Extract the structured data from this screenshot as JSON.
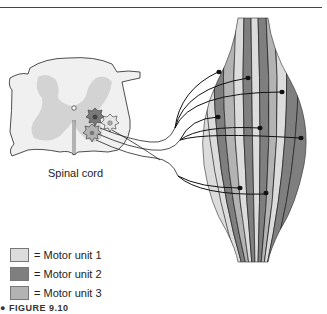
{
  "figure": {
    "spinal_cord_label": "Spinal cord",
    "caption_partial": "● FIGURE 9.10"
  },
  "legend": {
    "items": [
      {
        "label": "= Motor unit 1",
        "color": "#dcdcdc"
      },
      {
        "label": "= Motor unit 2",
        "color": "#7f7f7f"
      },
      {
        "label": "= Motor unit 3",
        "color": "#b3b3b3"
      }
    ]
  },
  "colors": {
    "unit1": "#dcdcdc",
    "unit2": "#7f7f7f",
    "unit3": "#b3b3b3",
    "gray_matter": "#d2d2d2",
    "cord_fill": "#efefef",
    "outline": "#222222"
  }
}
